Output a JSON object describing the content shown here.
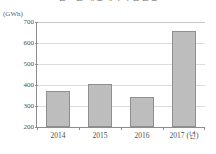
{
  "chart_data": {
    "type": "bar",
    "title": "연도별 재생에너지 발전량",
    "xlabel": "",
    "ylabel": "",
    "y_unit_label": "(GWh)",
    "x_unit_suffix": "(년)",
    "categories": [
      "2014",
      "2015",
      "2016",
      "2017"
    ],
    "tick_labels": [
      "2014",
      "2015",
      "2016",
      "2017 (년)"
    ],
    "values": [
      372,
      406,
      344,
      655
    ],
    "ylim": [
      200,
      700
    ],
    "yticks": [
      200,
      300,
      400,
      500,
      600,
      700
    ],
    "ytick_labels": [
      "200",
      "300",
      "400",
      "500",
      "600",
      "700"
    ],
    "grid": true,
    "legend": false,
    "colors": {
      "bar_fill": "#bdbdbd",
      "bar_border": "#8f8f8f",
      "gridline": "#dcdcdc",
      "axis": "#8d8d8d",
      "text": "#4f4f4f",
      "background": "#ffffff"
    }
  }
}
